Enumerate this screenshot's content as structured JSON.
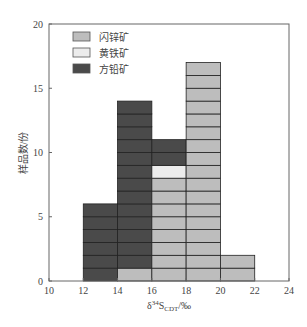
{
  "chart_data": {
    "type": "bar",
    "stacked": true,
    "title": "",
    "xlabel": "δ34S_CDT/‰",
    "ylabel": "样品数/份",
    "xlim": [
      10,
      24
    ],
    "ylim": [
      0,
      20
    ],
    "x_ticks": [
      10,
      12,
      14,
      16,
      18,
      20,
      22,
      24
    ],
    "y_ticks": [
      0,
      5,
      10,
      15,
      20
    ],
    "bins": [
      "12-14",
      "14-16",
      "16-18",
      "18-20",
      "20-22"
    ],
    "bin_edges": [
      [
        12,
        14
      ],
      [
        14,
        16
      ],
      [
        16,
        18
      ],
      [
        18,
        20
      ],
      [
        20,
        22
      ]
    ],
    "series": [
      {
        "name": "闪锌矿",
        "color": "#bdbdbd",
        "values": [
          0,
          1,
          8,
          17,
          2
        ]
      },
      {
        "name": "黄铁矿",
        "color": "#ececec",
        "values": [
          0,
          0,
          1,
          0,
          0
        ]
      },
      {
        "name": "方铅矿",
        "color": "#4a4a4a",
        "values": [
          6,
          13,
          2,
          0,
          0
        ]
      }
    ],
    "legend_position": "upper left",
    "grid": false
  },
  "legend": {
    "items": [
      {
        "label": "闪锌矿",
        "color": "#bdbdbd"
      },
      {
        "label": "黄铁矿",
        "color": "#ececec"
      },
      {
        "label": "方铅矿",
        "color": "#4a4a4a"
      }
    ]
  },
  "axes": {
    "ylabel": "样品数/份",
    "xlabel_main": "δ",
    "xlabel_sup": "34",
    "xlabel_S": "S",
    "xlabel_sub": "CDT",
    "xlabel_unit": "/‰"
  }
}
